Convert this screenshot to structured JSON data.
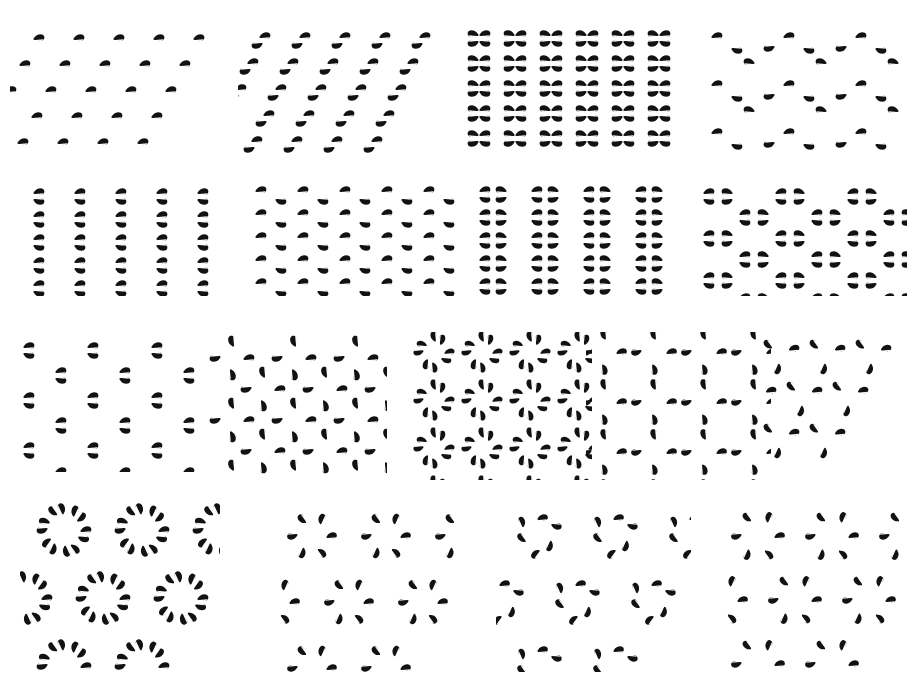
{
  "figure": {
    "background_color": "#ffffff",
    "ink_color": "#121212",
    "width": 914,
    "height": 677,
    "rows": 4,
    "cells_per_row": [
      4,
      4,
      5,
      4
    ],
    "total_cells": 17,
    "motif_name": "comma",
    "motif_description": "solid black teardrop head with a tapering horizontal tail"
  },
  "motif": {
    "name": "comma",
    "base_length": 17,
    "base_height": 9,
    "path": "M 0 0 C 2.4 -4.6 9.2 -5.0 10.2 -1.6 C 11.1 1.4 8.0 3.4 5.2 2.6 C 7.0 3.0 8.6 2.4 9.4 1.2 L 1.2 2.0 C -1.0 2.2 -1.0 1.0 0 0 Z",
    "path_note": "head lobe at right, tail sweeping left"
  },
  "cells": [
    {
      "id": "cell-01",
      "index": 1,
      "group": "p1",
      "x": 10,
      "y": 14,
      "w": 215,
      "h": 140,
      "lattice": "oblique",
      "cols": 5,
      "rows": 5,
      "dx": 40,
      "dy": 26,
      "shear": -14,
      "origin_x": 24,
      "origin_y": 24,
      "scale": 1.0,
      "motifs": [
        {
          "ox": 0,
          "oy": 0,
          "rot": 0,
          "flip": 0
        }
      ]
    },
    {
      "id": "cell-02",
      "index": 2,
      "group": "p2",
      "x": 238,
      "y": 14,
      "w": 215,
      "h": 140,
      "lattice": "oblique",
      "cols": 5,
      "rows": 5,
      "dx": 40,
      "dy": 26,
      "shear": -12,
      "origin_x": 22,
      "origin_y": 22,
      "scale": 1.0,
      "motifs": [
        {
          "ox": 0,
          "oy": 0,
          "rot": 0,
          "flip": 0
        },
        {
          "ox": 2,
          "oy": 9,
          "rot": 180,
          "flip": 0
        }
      ]
    },
    {
      "id": "cell-03",
      "index": 3,
      "group": "pmm",
      "x": 464,
      "y": 14,
      "w": 215,
      "h": 140,
      "lattice": "rectangular",
      "cols": 6,
      "rows": 5,
      "dx": 36,
      "dy": 25,
      "shear": 0,
      "origin_x": 16,
      "origin_y": 20,
      "scale": 1.0,
      "motifs": [
        {
          "ox": 0,
          "oy": 0,
          "rot": 0,
          "flip": 0
        },
        {
          "ox": 0,
          "oy": 9,
          "rot": 0,
          "flip": 1
        },
        {
          "ox": -2,
          "oy": 0,
          "rot": 0,
          "flip": 2
        },
        {
          "ox": -2,
          "oy": 9,
          "rot": 0,
          "flip": 3
        }
      ]
    },
    {
      "id": "cell-04",
      "index": 4,
      "group": "pg",
      "x": 690,
      "y": 14,
      "w": 215,
      "h": 140,
      "lattice": "rectangular",
      "cols": 3,
      "rows": 3,
      "dx": 72,
      "dy": 48,
      "shear": 0,
      "origin_x": 22,
      "origin_y": 22,
      "scale": 1.0,
      "motifs": [
        {
          "ox": 0,
          "oy": 0,
          "rot": 0,
          "flip": 0
        },
        {
          "ox": 20,
          "oy": 14,
          "rot": 0,
          "flip": 1
        },
        {
          "ox": 42,
          "oy": 26,
          "rot": 0,
          "flip": 2
        },
        {
          "ox": 62,
          "oy": 12,
          "rot": 0,
          "flip": 3
        }
      ]
    },
    {
      "id": "cell-05",
      "index": 5,
      "group": "pm",
      "x": 14,
      "y": 176,
      "w": 215,
      "h": 120,
      "lattice": "rectangular",
      "cols": 5,
      "rows": 5,
      "dx": 41,
      "dy": 23,
      "shear": 0,
      "origin_x": 20,
      "origin_y": 16,
      "scale": 1.0,
      "motifs": [
        {
          "ox": 0,
          "oy": 0,
          "rot": 0,
          "flip": 0
        },
        {
          "ox": 0,
          "oy": 9,
          "rot": 0,
          "flip": 1
        }
      ]
    },
    {
      "id": "cell-06",
      "index": 6,
      "group": "pg-vertical",
      "x": 240,
      "y": 176,
      "w": 215,
      "h": 120,
      "lattice": "rectangular",
      "cols": 5,
      "rows": 5,
      "dx": 42,
      "dy": 23,
      "shear": 0,
      "origin_x": 16,
      "origin_y": 14,
      "scale": 1.0,
      "motifs": [
        {
          "ox": 0,
          "oy": 0,
          "rot": 0,
          "flip": 0
        },
        {
          "ox": 20,
          "oy": 11,
          "rot": 0,
          "flip": 1
        }
      ]
    },
    {
      "id": "cell-07",
      "index": 7,
      "group": "cm",
      "x": 466,
      "y": 176,
      "w": 215,
      "h": 120,
      "lattice": "centred-rectangular",
      "cols": 4,
      "rows": 5,
      "dx": 52,
      "dy": 23,
      "shear": 0,
      "origin_x": 14,
      "origin_y": 14,
      "scale": 1.0,
      "motifs": [
        {
          "ox": 0,
          "oy": 0,
          "rot": 0,
          "flip": 0
        },
        {
          "ox": 0,
          "oy": 9,
          "rot": 0,
          "flip": 1
        },
        {
          "ox": 26,
          "oy": 0,
          "rot": 0,
          "flip": 2
        },
        {
          "ox": 26,
          "oy": 9,
          "rot": 0,
          "flip": 3
        }
      ]
    },
    {
      "id": "cell-08",
      "index": 8,
      "group": "cmm",
      "x": 692,
      "y": 176,
      "w": 215,
      "h": 120,
      "lattice": "centred-rectangular",
      "cols": 3,
      "rows": 3,
      "dx": 72,
      "dy": 42,
      "shear": 0,
      "origin_x": 12,
      "origin_y": 16,
      "scale": 1.0,
      "motifs": [
        {
          "ox": 0,
          "oy": 0,
          "rot": 0,
          "flip": 0
        },
        {
          "ox": 0,
          "oy": 9,
          "rot": 0,
          "flip": 1
        },
        {
          "ox": 28,
          "oy": 0,
          "rot": 0,
          "flip": 2
        },
        {
          "ox": 28,
          "oy": 9,
          "rot": 0,
          "flip": 3
        },
        {
          "ox": 36,
          "oy": 21,
          "rot": 0,
          "flip": 0
        },
        {
          "ox": 36,
          "oy": 30,
          "rot": 0,
          "flip": 1
        },
        {
          "ox": 64,
          "oy": 21,
          "rot": 0,
          "flip": 2
        },
        {
          "ox": 64,
          "oy": 30,
          "rot": 0,
          "flip": 3
        }
      ]
    },
    {
      "id": "cell-09",
      "index": 9,
      "group": "pmg",
      "x": 10,
      "y": 332,
      "w": 185,
      "h": 140,
      "lattice": "centred-rectangular",
      "cols": 3,
      "rows": 3,
      "dx": 64,
      "dy": 50,
      "shear": 0,
      "origin_x": 14,
      "origin_y": 14,
      "scale": 1.0,
      "motifs": [
        {
          "ox": 0,
          "oy": 0,
          "rot": 0,
          "flip": 0
        },
        {
          "ox": 0,
          "oy": 9,
          "rot": 0,
          "flip": 1
        },
        {
          "ox": 32,
          "oy": 25,
          "rot": 0,
          "flip": 0
        },
        {
          "ox": 32,
          "oy": 34,
          "rot": 0,
          "flip": 1
        }
      ]
    },
    {
      "id": "cell-10",
      "index": 10,
      "group": "p4",
      "x": 202,
      "y": 332,
      "w": 185,
      "h": 145,
      "lattice": "square",
      "cols": 3,
      "rows": 3,
      "dx": 62,
      "dy": 62,
      "shear": 0,
      "origin_x": 30,
      "origin_y": 26,
      "scale": 1.0,
      "rosette": {
        "n": 4,
        "radius": 12,
        "start_angle": 0,
        "spin": 90
      },
      "offset_rosette": {
        "dx": 31,
        "dy": 31
      },
      "motifs": [
        {
          "ox": 0,
          "oy": 0,
          "rot": 0,
          "flip": 0
        },
        {
          "ox": 0,
          "oy": 0,
          "rot": 90,
          "flip": 0
        },
        {
          "ox": 0,
          "oy": 0,
          "rot": 180,
          "flip": 0
        },
        {
          "ox": 0,
          "oy": 0,
          "rot": 270,
          "flip": 0
        }
      ]
    },
    {
      "id": "cell-11",
      "index": 11,
      "group": "p4m",
      "x": 412,
      "y": 332,
      "w": 180,
      "h": 148,
      "lattice": "square",
      "cols": 4,
      "rows": 4,
      "dx": 48,
      "dy": 48,
      "shear": 0,
      "origin_x": 22,
      "origin_y": 20,
      "scale": 0.92,
      "rosette": {
        "n": 8,
        "radius": 11,
        "start_angle": 0,
        "spin": 45
      },
      "motifs": [
        {
          "ox": 0,
          "oy": 0,
          "rot": 0,
          "flip": 0
        },
        {
          "ox": 0,
          "oy": 0,
          "rot": 0,
          "flip": 1
        },
        {
          "ox": 0,
          "oy": 0,
          "rot": 90,
          "flip": 0
        },
        {
          "ox": 0,
          "oy": 0,
          "rot": 90,
          "flip": 1
        },
        {
          "ox": 0,
          "oy": 0,
          "rot": 180,
          "flip": 0
        },
        {
          "ox": 0,
          "oy": 0,
          "rot": 180,
          "flip": 1
        },
        {
          "ox": 0,
          "oy": 0,
          "rot": 270,
          "flip": 0
        },
        {
          "ox": 0,
          "oy": 0,
          "rot": 270,
          "flip": 1
        }
      ]
    },
    {
      "id": "cell-12",
      "index": 12,
      "group": "p4g",
      "x": 586,
      "y": 332,
      "w": 185,
      "h": 148,
      "lattice": "square",
      "cols": 4,
      "rows": 4,
      "dx": 50,
      "dy": 50,
      "shear": 0,
      "origin_x": 18,
      "origin_y": 20,
      "scale": 0.95,
      "rosette": {
        "n": 4,
        "radius": 13,
        "start_angle": 0,
        "spin": 90
      },
      "motifs": [
        {
          "ox": 0,
          "oy": 0,
          "rot": 0,
          "flip": 0
        },
        {
          "ox": 0,
          "oy": 0,
          "rot": 90,
          "flip": 0
        },
        {
          "ox": 0,
          "oy": 0,
          "rot": 180,
          "flip": 0
        },
        {
          "ox": 0,
          "oy": 0,
          "rot": 270,
          "flip": 0
        }
      ]
    },
    {
      "id": "cell-13",
      "index": 13,
      "group": "p3",
      "x": 760,
      "y": 332,
      "w": 150,
      "h": 150,
      "lattice": "hexagonal",
      "cols": 3,
      "rows": 3,
      "dx": 46,
      "dy": 42,
      "shear": -23,
      "origin_x": 20,
      "origin_y": 22,
      "scale": 0.95,
      "rosette": {
        "n": 3,
        "radius": 11,
        "start_angle": -30,
        "spin": 120
      },
      "motifs": [
        {
          "ox": 0,
          "oy": 0,
          "rot": 0,
          "flip": 0
        },
        {
          "ox": 0,
          "oy": 0,
          "rot": 120,
          "flip": 0
        },
        {
          "ox": 0,
          "oy": 0,
          "rot": 240,
          "flip": 0
        }
      ]
    },
    {
      "id": "cell-14",
      "index": 14,
      "group": "p6m",
      "x": 20,
      "y": 496,
      "w": 200,
      "h": 175,
      "lattice": "hexagonal",
      "cols": 3,
      "rows": 3,
      "dx": 78,
      "dy": 68,
      "shear": -39,
      "origin_x": 44,
      "origin_y": 34,
      "scale": 1.0,
      "rosette": {
        "n": 12,
        "radius": 17,
        "start_angle": 0,
        "spin": 30
      },
      "motifs": [
        {
          "ox": 0,
          "oy": 0,
          "rot": 0,
          "flip": 0
        },
        {
          "ox": 0,
          "oy": 0,
          "rot": 0,
          "flip": 1
        },
        {
          "ox": 0,
          "oy": 0,
          "rot": 60,
          "flip": 0
        },
        {
          "ox": 0,
          "oy": 0,
          "rot": 60,
          "flip": 1
        },
        {
          "ox": 0,
          "oy": 0,
          "rot": 120,
          "flip": 0
        },
        {
          "ox": 0,
          "oy": 0,
          "rot": 120,
          "flip": 1
        },
        {
          "ox": 0,
          "oy": 0,
          "rot": 180,
          "flip": 0
        },
        {
          "ox": 0,
          "oy": 0,
          "rot": 180,
          "flip": 1
        },
        {
          "ox": 0,
          "oy": 0,
          "rot": 240,
          "flip": 0
        },
        {
          "ox": 0,
          "oy": 0,
          "rot": 240,
          "flip": 1
        },
        {
          "ox": 0,
          "oy": 0,
          "rot": 300,
          "flip": 0
        },
        {
          "ox": 0,
          "oy": 0,
          "rot": 300,
          "flip": 1
        }
      ]
    },
    {
      "id": "cell-15",
      "index": 15,
      "group": "p6",
      "x": 272,
      "y": 502,
      "w": 190,
      "h": 170,
      "lattice": "hexagonal",
      "cols": 3,
      "rows": 3,
      "dx": 74,
      "dy": 66,
      "shear": -37,
      "origin_x": 40,
      "origin_y": 34,
      "scale": 0.95,
      "rosette": {
        "n": 6,
        "radius": 15,
        "start_angle": 0,
        "spin": 60
      },
      "motifs": [
        {
          "ox": 0,
          "oy": 0,
          "rot": 0,
          "flip": 0
        },
        {
          "ox": 0,
          "oy": 0,
          "rot": 60,
          "flip": 0
        },
        {
          "ox": 0,
          "oy": 0,
          "rot": 120,
          "flip": 0
        },
        {
          "ox": 0,
          "oy": 0,
          "rot": 180,
          "flip": 0
        },
        {
          "ox": 0,
          "oy": 0,
          "rot": 240,
          "flip": 0
        },
        {
          "ox": 0,
          "oy": 0,
          "rot": 300,
          "flip": 0
        }
      ]
    },
    {
      "id": "cell-16",
      "index": 16,
      "group": "p3m1",
      "x": 496,
      "y": 502,
      "w": 195,
      "h": 170,
      "lattice": "hexagonal",
      "cols": 3,
      "rows": 3,
      "dx": 76,
      "dy": 66,
      "shear": -38,
      "origin_x": 42,
      "origin_y": 32,
      "scale": 0.95,
      "rosette": {
        "n": 6,
        "radius": 16,
        "start_angle": -90,
        "spin": 60
      },
      "motifs": [
        {
          "ox": 0,
          "oy": 0,
          "rot": 0,
          "flip": 0
        },
        {
          "ox": 0,
          "oy": 0,
          "rot": 0,
          "flip": 1
        },
        {
          "ox": 0,
          "oy": 0,
          "rot": 120,
          "flip": 0
        },
        {
          "ox": 0,
          "oy": 0,
          "rot": 120,
          "flip": 1
        },
        {
          "ox": 0,
          "oy": 0,
          "rot": 240,
          "flip": 0
        },
        {
          "ox": 0,
          "oy": 0,
          "rot": 240,
          "flip": 1
        }
      ]
    },
    {
      "id": "cell-17",
      "index": 17,
      "group": "p31m",
      "x": 716,
      "y": 502,
      "w": 195,
      "h": 170,
      "lattice": "hexagonal",
      "cols": 3,
      "rows": 3,
      "dx": 74,
      "dy": 64,
      "shear": -37,
      "origin_x": 42,
      "origin_y": 34,
      "scale": 0.95,
      "rosette": {
        "n": 6,
        "radius": 17,
        "start_angle": 0,
        "spin": 60
      },
      "motifs": [
        {
          "ox": 0,
          "oy": 0,
          "rot": 0,
          "flip": 0
        },
        {
          "ox": 0,
          "oy": 0,
          "rot": 60,
          "flip": 0
        },
        {
          "ox": 0,
          "oy": 0,
          "rot": 120,
          "flip": 0
        },
        {
          "ox": 0,
          "oy": 0,
          "rot": 180,
          "flip": 0
        },
        {
          "ox": 0,
          "oy": 0,
          "rot": 240,
          "flip": 0
        },
        {
          "ox": 0,
          "oy": 0,
          "rot": 300,
          "flip": 0
        }
      ]
    }
  ]
}
